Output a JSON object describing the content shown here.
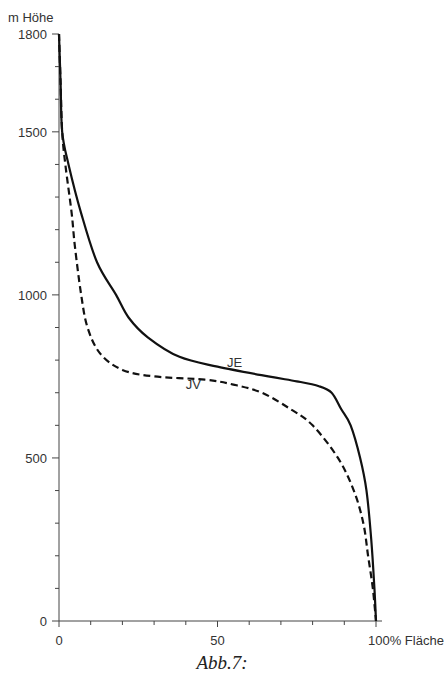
{
  "chart_data": {
    "type": "line",
    "title": "",
    "caption": "Abb.7:",
    "ylabel": "m Höhe",
    "xlabel": "% Fläche",
    "xlim": [
      0,
      100
    ],
    "ylim": [
      0,
      1800
    ],
    "x_ticks_major": [
      0,
      50,
      100
    ],
    "x_tick_labels": [
      "0",
      "50",
      "100% Fläche"
    ],
    "x_ticks_minor_step": 10,
    "y_ticks_major": [
      0,
      500,
      1000,
      1500,
      1800
    ],
    "y_tick_labels": [
      "0",
      "500",
      "1000",
      "1500",
      "1800"
    ],
    "y_ticks_minor_step": 100,
    "grid": false,
    "legend": "inline labels",
    "series": [
      {
        "name": "JE",
        "style": "solid",
        "points": [
          [
            0,
            1800
          ],
          [
            0.5,
            1650
          ],
          [
            1,
            1500
          ],
          [
            3,
            1400
          ],
          [
            7,
            1250
          ],
          [
            12,
            1100
          ],
          [
            18,
            1000
          ],
          [
            22,
            930
          ],
          [
            28,
            870
          ],
          [
            38,
            810
          ],
          [
            50,
            780
          ],
          [
            66,
            750
          ],
          [
            75,
            735
          ],
          [
            82,
            720
          ],
          [
            86,
            700
          ],
          [
            89,
            650
          ],
          [
            92,
            600
          ],
          [
            95,
            500
          ],
          [
            97,
            400
          ],
          [
            98.5,
            250
          ],
          [
            99.5,
            100
          ],
          [
            100,
            0
          ]
        ]
      },
      {
        "name": "JV",
        "style": "dashed",
        "points": [
          [
            0,
            1800
          ],
          [
            0.5,
            1650
          ],
          [
            1,
            1500
          ],
          [
            2,
            1400
          ],
          [
            4,
            1250
          ],
          [
            5,
            1150
          ],
          [
            7,
            1000
          ],
          [
            9,
            900
          ],
          [
            13,
            820
          ],
          [
            20,
            770
          ],
          [
            30,
            750
          ],
          [
            46,
            740
          ],
          [
            55,
            725
          ],
          [
            64,
            700
          ],
          [
            73,
            650
          ],
          [
            80,
            600
          ],
          [
            88,
            500
          ],
          [
            93,
            400
          ],
          [
            96,
            300
          ],
          [
            97.5,
            200
          ],
          [
            99,
            100
          ],
          [
            100,
            0
          ]
        ]
      }
    ],
    "annotations": [
      {
        "text": "JE",
        "x": 53,
        "y": 780
      },
      {
        "text": "JV",
        "x": 40,
        "y": 712
      }
    ]
  }
}
